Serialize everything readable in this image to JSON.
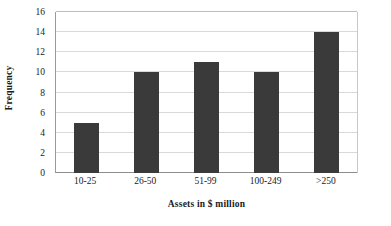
{
  "chart_data": {
    "type": "bar",
    "title": "",
    "xlabel": "Assets in $ million",
    "ylabel": "Frequency",
    "categories": [
      "10-25",
      "26-50",
      "51-99",
      "100-249",
      ">250"
    ],
    "values": [
      5,
      10,
      11,
      10,
      14
    ],
    "ylim": [
      0,
      16
    ],
    "yticks": [
      0,
      2,
      4,
      6,
      8,
      10,
      12,
      14,
      16
    ],
    "ytick_labels": [
      "0",
      "2",
      "4",
      "6",
      "8",
      "10",
      "12",
      "14",
      "16"
    ],
    "grid": "horizontal",
    "legend": "none",
    "bar_color": "#3a3a3a",
    "gridline_color": "#d9d9d9",
    "axis_color": "#8d8d8d",
    "background_color": "#ffffff"
  }
}
